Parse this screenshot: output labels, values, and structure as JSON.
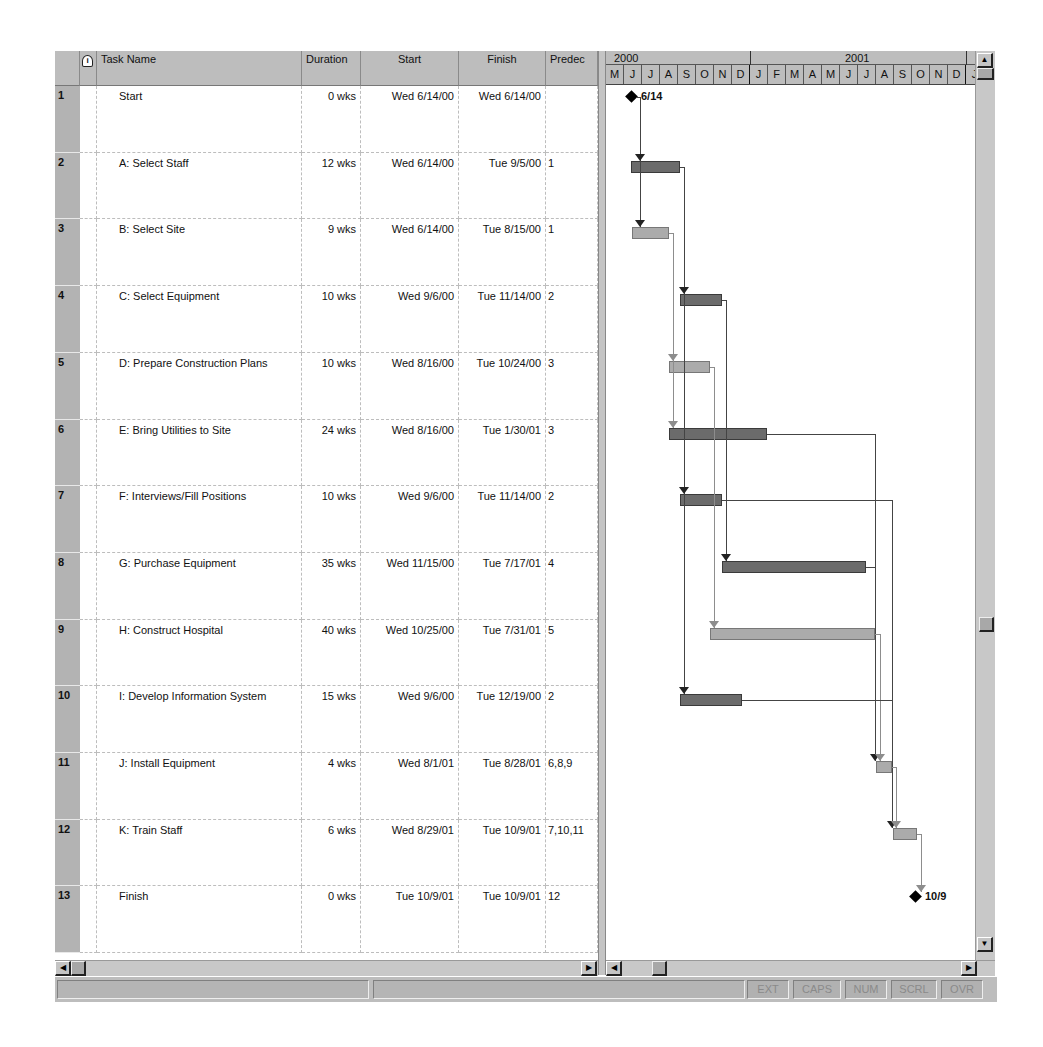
{
  "table": {
    "columns": {
      "indicator_icon": "info-icon",
      "task_name": "Task Name",
      "duration": "Duration",
      "start": "Start",
      "finish": "Finish",
      "predecessors": "Predec"
    },
    "rows": [
      {
        "id": "1",
        "name": "Start",
        "duration": "0 wks",
        "start": "Wed 6/14/00",
        "finish": "Wed 6/14/00",
        "pred": ""
      },
      {
        "id": "2",
        "name": "A: Select Staff",
        "duration": "12 wks",
        "start": "Wed 6/14/00",
        "finish": "Tue 9/5/00",
        "pred": "1"
      },
      {
        "id": "3",
        "name": "B: Select Site",
        "duration": "9 wks",
        "start": "Wed 6/14/00",
        "finish": "Tue 8/15/00",
        "pred": "1"
      },
      {
        "id": "4",
        "name": "C: Select Equipment",
        "duration": "10 wks",
        "start": "Wed 9/6/00",
        "finish": "Tue 11/14/00",
        "pred": "2"
      },
      {
        "id": "5",
        "name": "D: Prepare Construction Plans",
        "duration": "10 wks",
        "start": "Wed 8/16/00",
        "finish": "Tue 10/24/00",
        "pred": "3"
      },
      {
        "id": "6",
        "name": "E: Bring Utilities to Site",
        "duration": "24 wks",
        "start": "Wed 8/16/00",
        "finish": "Tue 1/30/01",
        "pred": "3"
      },
      {
        "id": "7",
        "name": "F: Interviews/Fill Positions",
        "duration": "10 wks",
        "start": "Wed 9/6/00",
        "finish": "Tue 11/14/00",
        "pred": "2"
      },
      {
        "id": "8",
        "name": "G: Purchase Equipment",
        "duration": "35 wks",
        "start": "Wed 11/15/00",
        "finish": "Tue 7/17/01",
        "pred": "4"
      },
      {
        "id": "9",
        "name": "H: Construct Hospital",
        "duration": "40 wks",
        "start": "Wed 10/25/00",
        "finish": "Tue 7/31/01",
        "pred": "5"
      },
      {
        "id": "10",
        "name": "I: Develop Information System",
        "duration": "15 wks",
        "start": "Wed 9/6/00",
        "finish": "Tue 12/19/00",
        "pred": "2"
      },
      {
        "id": "11",
        "name": "J: Install Equipment",
        "duration": "4 wks",
        "start": "Wed 8/1/01",
        "finish": "Tue 8/28/01",
        "pred": "6,8,9"
      },
      {
        "id": "12",
        "name": "K: Train Staff",
        "duration": "6 wks",
        "start": "Wed 8/29/01",
        "finish": "Tue 10/9/01",
        "pred": "7,10,11"
      },
      {
        "id": "13",
        "name": "Finish",
        "duration": "0 wks",
        "start": "Tue 10/9/01",
        "finish": "Tue 10/9/01",
        "pred": "12"
      }
    ]
  },
  "timescale": {
    "years": [
      {
        "label": "2000",
        "x": 0
      },
      {
        "label": "2001",
        "x": 144
      }
    ],
    "year_dividers": [
      144,
      360
    ],
    "months": [
      "M",
      "J",
      "J",
      "A",
      "S",
      "O",
      "N",
      "D",
      "J",
      "F",
      "M",
      "A",
      "M",
      "J",
      "J",
      "A",
      "S",
      "O",
      "N",
      "D",
      "J"
    ]
  },
  "gantt": {
    "bars": [
      {
        "row": 2,
        "x1": 631,
        "x2": 680,
        "critical": true
      },
      {
        "row": 3,
        "x1": 632,
        "x2": 669,
        "critical": false
      },
      {
        "row": 4,
        "x1": 680,
        "x2": 722,
        "critical": true
      },
      {
        "row": 5,
        "x1": 669,
        "x2": 710,
        "critical": false
      },
      {
        "row": 6,
        "x1": 669,
        "x2": 767,
        "critical": true
      },
      {
        "row": 7,
        "x1": 680,
        "x2": 722,
        "critical": true
      },
      {
        "row": 8,
        "x1": 722,
        "x2": 866,
        "critical": true
      },
      {
        "row": 9,
        "x1": 710,
        "x2": 875,
        "critical": false
      },
      {
        "row": 10,
        "x1": 680,
        "x2": 742,
        "critical": true
      },
      {
        "row": 11,
        "x1": 876,
        "x2": 892,
        "critical": false
      },
      {
        "row": 12,
        "x1": 893,
        "x2": 917,
        "critical": false
      }
    ],
    "milestones": [
      {
        "row": 1,
        "x": 632,
        "label": "6/14"
      },
      {
        "row": 13,
        "x": 916,
        "label": "10/9"
      }
    ]
  },
  "scrollbars": {
    "up_arrow": "▲",
    "down_arrow": "▼",
    "left_arrow": "◀",
    "right_arrow": "▶"
  },
  "statusbar": {
    "indicators": [
      "EXT",
      "CAPS",
      "NUM",
      "SCRL",
      "OVR"
    ]
  },
  "colors": {
    "critical_bar": "#6b6b6b",
    "noncritical_bar": "#ababab",
    "header_bg": "#bdbdbd",
    "milestone": "#000000"
  }
}
